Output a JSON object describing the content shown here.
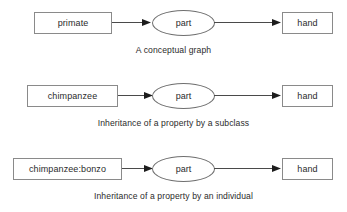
{
  "figure": {
    "background_color": "#ffffff",
    "stroke_color": "#8a8a8a",
    "text_color": "#2b2b2b",
    "rows": [
      {
        "source_label": "primate",
        "relation_label": "part",
        "target_label": "hand",
        "caption": "A conceptual graph"
      },
      {
        "source_label": "chimpanzee",
        "relation_label": "part",
        "target_label": "hand",
        "caption": "Inheritance of a property by a subclass"
      },
      {
        "source_label": "chimpanzee:bonzo",
        "relation_label": "part",
        "target_label": "hand",
        "caption": "Inheritance of a property by an individual"
      }
    ]
  }
}
